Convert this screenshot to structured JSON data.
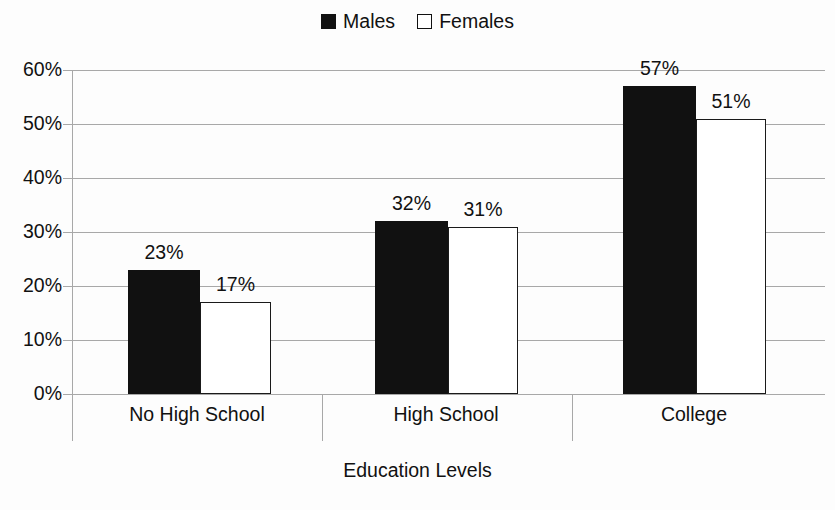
{
  "chart_data": {
    "type": "bar",
    "title": "",
    "xlabel": "Education Levels",
    "ylabel": "",
    "categories": [
      "No High School",
      "High School",
      "College"
    ],
    "series": [
      {
        "name": "Males",
        "values": [
          23,
          32,
          57
        ],
        "color": "#111111",
        "fill": "solid"
      },
      {
        "name": "Females",
        "values": [
          17,
          31,
          51
        ],
        "color": "#ffffff",
        "fill": "hollow"
      }
    ],
    "value_labels": [
      [
        "23%",
        "17%"
      ],
      [
        "32%",
        "31%"
      ],
      [
        "57%",
        "51%"
      ]
    ],
    "ylim": [
      0,
      60
    ],
    "ytick_values": [
      60,
      50,
      40,
      30,
      20,
      10,
      0
    ],
    "ytick_labels": [
      "60%",
      "50%",
      "40%",
      "30%",
      "20%",
      "10%",
      "0%"
    ],
    "grid": true,
    "legend_position": "top-center",
    "units": "percent"
  },
  "legend": {
    "entries": [
      {
        "label": "Males",
        "swatch": "filled-square-icon"
      },
      {
        "label": "Females",
        "swatch": "hollow-square-icon"
      }
    ]
  },
  "axis": {
    "x_title": "Education Levels"
  },
  "colors": {
    "males": "#111111",
    "females": "#ffffff",
    "outline": "#1a1a1a",
    "grid": "#a8a8a8",
    "text": "#111111",
    "background": "#fdfdfd"
  }
}
